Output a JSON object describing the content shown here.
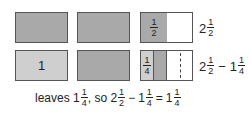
{
  "row1": {
    "box3_fraction": {
      "num": "1",
      "den": "2"
    },
    "label": {
      "whole": "2",
      "num": "1",
      "den": "2"
    }
  },
  "row2": {
    "box1_text": "1",
    "box3_fraction": {
      "num": "1",
      "den": "4"
    },
    "label": {
      "a_whole": "2",
      "a_num": "1",
      "a_den": "2",
      "op": "−",
      "b_whole": "1",
      "b_num": "1",
      "b_den": "4"
    }
  },
  "caption": {
    "prefix": "leaves ",
    "v1_whole": "1",
    "v1_num": "1",
    "v1_den": "4",
    "mid": ", so ",
    "a_whole": "2",
    "a_num": "1",
    "a_den": "2",
    "op": "−",
    "b_whole": "1",
    "b_num": "1",
    "b_den": "4",
    "eq": "=",
    "r_whole": "1",
    "r_num": "1",
    "r_den": "4"
  },
  "colors": {
    "dark": "#a9a9a9",
    "light": "#cfcfcf",
    "border": "#555555"
  }
}
